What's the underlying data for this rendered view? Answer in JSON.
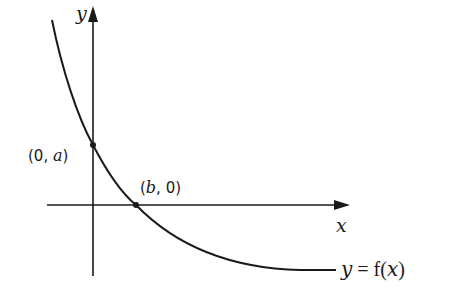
{
  "diagram": {
    "type": "function-graph",
    "axes": {
      "x_label": "x",
      "y_label": "y"
    },
    "points": [
      {
        "label_prefix": "(0, ",
        "label_var": "a",
        "label_suffix": ")",
        "meaning": "y-intercept"
      },
      {
        "label_prefix": "(",
        "label_var": "b",
        "label_suffix": ", 0)",
        "meaning": "x-intercept"
      }
    ],
    "curve_label": {
      "lhs": "y",
      "eq": " = ",
      "func": "f(",
      "var": "x",
      "close": ")"
    },
    "colors": {
      "ink": "#1a1a1a",
      "background": "#ffffff"
    }
  }
}
